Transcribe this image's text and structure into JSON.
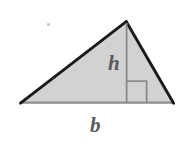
{
  "figure": {
    "kind": "geometry-diagram",
    "background_color": "#ffffff",
    "labels": {
      "height": "h",
      "base": "b"
    },
    "colors": {
      "fill": "#d2d2d2",
      "slant_edge": "#1a1a1a",
      "base_edge": "#8d8d8d",
      "height_line": "#8a8a8a",
      "right_angle_marker": "#8a8a8a",
      "label_text": "#5a5a5a"
    },
    "geometry": {
      "apex": [
        126,
        22
      ],
      "bottom_left": [
        21,
        103
      ],
      "bottom_right": [
        173,
        103
      ],
      "foot_of_height": [
        126,
        103
      ],
      "right_angle_square": {
        "x": 127,
        "y": 81,
        "width": 20,
        "height": 22
      }
    },
    "annotations": {
      "height_segment_label": "h",
      "base_segment_label": "b"
    }
  }
}
